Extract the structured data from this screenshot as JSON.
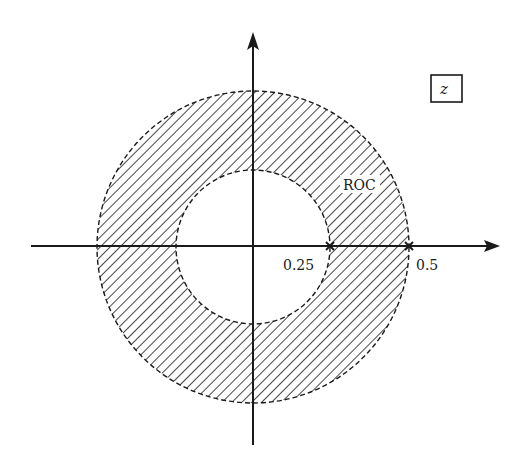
{
  "diagram": {
    "type": "z-plane region of convergence",
    "plane_label": "z",
    "region_label": "ROC",
    "axis_ticks": [
      {
        "label": "0.25",
        "value": 0.25
      },
      {
        "label": "0.5",
        "value": 0.5
      }
    ],
    "inner_radius": 0.25,
    "outer_radius": 0.5,
    "colors": {
      "ink": "#1a1a1a",
      "background": "#ffffff"
    }
  }
}
